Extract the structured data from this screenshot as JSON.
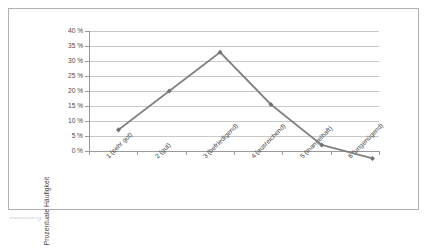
{
  "chart_data": {
    "type": "line",
    "title": "",
    "subtitle": "",
    "xlabel": "",
    "ylabel": "Prozentuale Häufigkeit",
    "categories": [
      "1 (sehr gut)",
      "2 (gut)",
      "3 (befriedigend)",
      "4 (ausreichend)",
      "5 (mangelhaft)",
      "6 (ungenügend)"
    ],
    "values": [
      11.5,
      23,
      34.5,
      19,
      7,
      3
    ],
    "ylim": [
      0,
      40
    ],
    "ytick_step": 5,
    "ytick_labels": [
      "40 %",
      "35 %",
      "30 %",
      "25 %",
      "20 %",
      "15 %",
      "10 %",
      "5 %",
      "0 %"
    ],
    "ytick_values": [
      40,
      35,
      30,
      25,
      20,
      15,
      10,
      5,
      0
    ],
    "grid": true,
    "grid_axis": "y",
    "legend": false,
    "legend_position": "none",
    "series": [
      {
        "name": "Prozentuale Häufigkeit",
        "values": [
          11.5,
          23,
          34.5,
          19,
          7,
          3
        ],
        "color": "#808080",
        "marker": "diamond",
        "marker_color": "#707070"
      }
    ],
    "colors": {
      "line": "#808080",
      "marker": "#707070",
      "gridline": "#c8c8c8",
      "axis": "#9a9a9a",
      "frame": "#b0b0b0",
      "plot_background": "#ffffff",
      "text": "#3f3f3f"
    }
  },
  "figure": {
    "frame_visible": true,
    "caption_fragment": "Abbildung"
  }
}
